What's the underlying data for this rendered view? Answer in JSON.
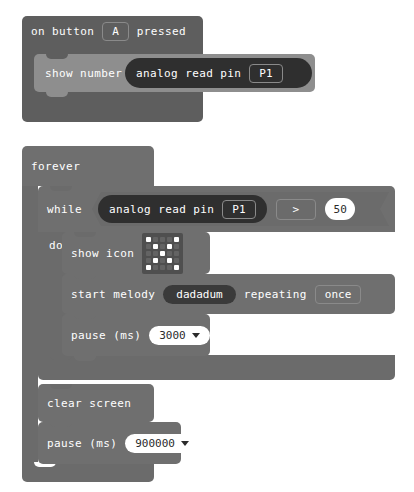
{
  "editor": {
    "name": "block-editor-canvas",
    "background": "#ffffff",
    "block_color": "#6b6b6b",
    "block_color_dark": "#5e5e5e",
    "block_color_light": "#8e8e8e",
    "reporter_color": "#2f2f2f",
    "text_color": "#ffffff",
    "field_text_color": "#2b2b2b"
  },
  "scripts": [
    {
      "id": "on-button-pressed-script",
      "hat": {
        "label_before": "on button",
        "button": "A",
        "label_after": "pressed"
      },
      "body": [
        {
          "id": "show-number",
          "label": "show number",
          "reporter": {
            "label": "analog read pin",
            "pin": "P1"
          }
        }
      ]
    },
    {
      "id": "forever-script",
      "hat": {
        "label_before": "forever"
      },
      "body": [
        {
          "id": "while-do",
          "while_label": "while",
          "do_label": "do",
          "condition": {
            "left": {
              "label": "analog read pin",
              "pin": "P1"
            },
            "operator": ">",
            "right": "50"
          },
          "do_body": [
            {
              "id": "show-icon",
              "label": "show icon",
              "matrix": [
                [
                  1,
                  0,
                  0,
                  0,
                  1
                ],
                [
                  0,
                  1,
                  0,
                  1,
                  0
                ],
                [
                  0,
                  0,
                  1,
                  0,
                  0
                ],
                [
                  0,
                  1,
                  0,
                  1,
                  0
                ],
                [
                  1,
                  0,
                  0,
                  0,
                  1
                ]
              ]
            },
            {
              "id": "start-melody",
              "label": "start melody",
              "melody": "dadadum",
              "repeating_label": "repeating",
              "repeat_mode": "once"
            },
            {
              "id": "pause-inner",
              "label": "pause (ms)",
              "value": "3000"
            }
          ]
        },
        {
          "id": "clear-screen",
          "label": "clear screen"
        },
        {
          "id": "pause-outer",
          "label": "pause (ms)",
          "value": "900000"
        }
      ]
    }
  ]
}
